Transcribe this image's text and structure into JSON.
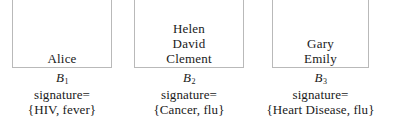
{
  "diagram": {
    "blocks": [
      {
        "id": "bucket-1",
        "members": [
          "Alice"
        ],
        "label_base": "B",
        "label_sub": "1",
        "signature_label": "signature=",
        "signature_value": "{HIV, fever}"
      },
      {
        "id": "bucket-2",
        "members": [
          "Helen",
          "David",
          "Clement"
        ],
        "label_base": "B",
        "label_sub": "2",
        "signature_label": "signature=",
        "signature_value": "{Cancer, flu}"
      },
      {
        "id": "bucket-3",
        "members": [
          "Gary",
          "Emily"
        ],
        "label_base": "B",
        "label_sub": "3",
        "signature_label": "signature=",
        "signature_value": "{Heart Disease, flu}"
      }
    ],
    "colors": {
      "text": "#1a1a1a",
      "border": "#b9b9b9",
      "background": "#ffffff"
    }
  }
}
